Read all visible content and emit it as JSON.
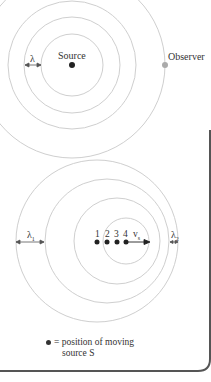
{
  "top_diagram": {
    "source_label": "Source",
    "observer_label": "Observer",
    "wavelength_label": "λ"
  },
  "bottom_diagram": {
    "wavelength_behind_label": "λ1",
    "wavelength_ahead_label": "λ2",
    "positions": [
      "1",
      "2",
      "3",
      "4"
    ],
    "velocity_label": "vs"
  },
  "legend": {
    "line1": "= position of moving",
    "line2": "source S"
  },
  "colors": {
    "circle": "#c8c8c8",
    "source": "#222222",
    "observer": "#aaaaaa",
    "frame": "#555555"
  }
}
